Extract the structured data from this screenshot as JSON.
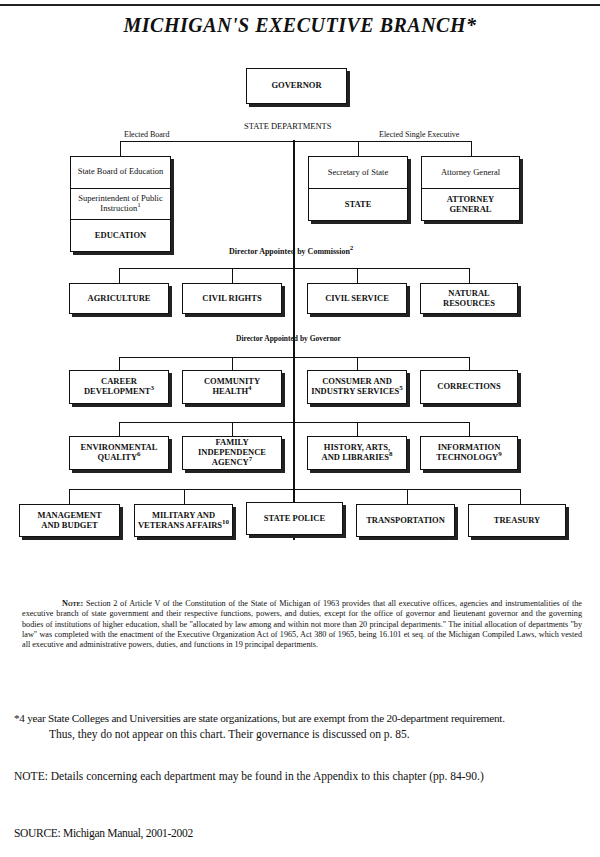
{
  "title": "MICHIGAN'S EXECUTIVE BRANCH*",
  "governor": "GOVERNOR",
  "state_departments_label": "STATE DEPARTMENTS",
  "elected_board": {
    "label": "Elected Board",
    "box": {
      "board": "State Board of Education",
      "superintendent": "Superintendent of Public Instruction",
      "superintendent_note": "1",
      "department": "EDUCATION"
    }
  },
  "elected_single_executive": {
    "label": "Elected Single Executive",
    "boxes": [
      {
        "official": "Secretary of State",
        "department": "STATE"
      },
      {
        "official": "Attorney General",
        "department": "ATTORNEY GENERAL"
      }
    ]
  },
  "commission": {
    "label": "Director Appointed by Commission",
    "label_note": "2",
    "departments": [
      {
        "name": "AGRICULTURE",
        "note": ""
      },
      {
        "name": "CIVIL RIGHTS",
        "note": ""
      },
      {
        "name": "CIVIL SERVICE",
        "note": ""
      },
      {
        "name": "NATURAL RESOURCES",
        "note": ""
      }
    ]
  },
  "governor_appointed": {
    "label": "Director Appointed by Governor",
    "row1": [
      {
        "name": "CAREER DEVELOPMENT",
        "note": "3"
      },
      {
        "name": "COMMUNITY HEALTH",
        "note": "4"
      },
      {
        "name": "CONSUMER AND INDUSTRY SERVICES",
        "note": "5"
      },
      {
        "name": "CORRECTIONS",
        "note": ""
      }
    ],
    "row2": [
      {
        "name": "ENVIRONMENTAL QUALITY",
        "note": "6"
      },
      {
        "name": "FAMILY INDEPENDENCE AGENCY",
        "note": "7"
      },
      {
        "name": "HISTORY, ARTS, AND LIBRARIES",
        "note": "8"
      },
      {
        "name": "INFORMATION TECHNOLOGY",
        "note": "9"
      }
    ],
    "row3": [
      {
        "name": "MANAGEMENT AND BUDGET",
        "note": ""
      },
      {
        "name": "MILITARY AND VETERANS AFFAIRS",
        "note": "10"
      },
      {
        "name": "STATE POLICE",
        "note": ""
      },
      {
        "name": "TRANSPORTATION",
        "note": ""
      },
      {
        "name": "TREASURY",
        "note": ""
      }
    ]
  },
  "note_block": {
    "lead": "Note:",
    "text": "Section 2 of Article V of the Constitution of the State of Michigan of 1963 provides that all executive offices, agencies and instrumentalities of the executive branch of state government and their respective functions, powers, and duties, except for the office of governor and lieutenant governor and the governing bodies of institutions of higher education, shall be \"allocated by law among and within not more than 20 principal departments.\" The initial allocation of departments \"by law\" was completed with the enactment of the Executive Organization Act of 1965, Act 380 of 1965, being 16.101 et seq. of the Michigan Compiled Laws, which vested all executive and administrative powers, duties, and functions in 19 principal departments."
  },
  "footnotes": {
    "asterisk_line1": "*4 year State Colleges and Universities are state organizations, but are exempt from the 20-department requirement.",
    "asterisk_line2": "Thus, they do not appear on this chart.  Their governance is discussed on p. 85.",
    "details_note": "NOTE:  Details concerning each department may be found in the Appendix to this chapter (pp. 84-90.)",
    "source": "SOURCE: Michigan Manual, 2001-2002"
  }
}
